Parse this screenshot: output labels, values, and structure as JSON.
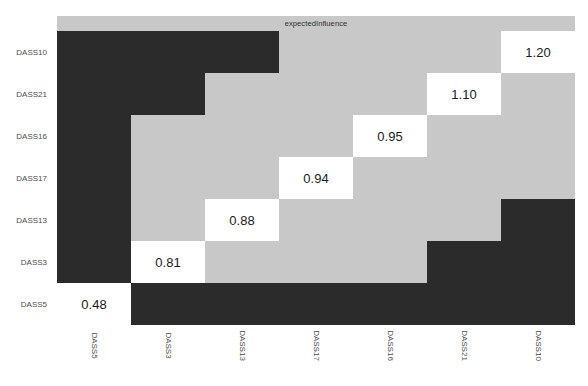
{
  "chart_data": {
    "type": "heatmap",
    "title": "expectedInfluence",
    "xlabel": "",
    "ylabel": "",
    "legend": "none",
    "grid": false,
    "x_categories": [
      "DASS5",
      "DASS3",
      "DASS13",
      "DASS17",
      "DASS16",
      "DASS21",
      "DASS10"
    ],
    "y_categories": [
      "DASS10",
      "DASS21",
      "DASS16",
      "DASS17",
      "DASS13",
      "DASS3",
      "DASS5"
    ],
    "colors": {
      "dark_cell": "#2b2b2b",
      "light_cell": "#c8c8c8",
      "value_cell": "#ffffff",
      "strip_background": "#c8c8c8",
      "text": "#1a1a1a",
      "axis_text": "#4d4d4d"
    },
    "labeled_values": [
      {
        "row": "DASS10",
        "column": "DASS10",
        "value": "1.20"
      },
      {
        "row": "DASS21",
        "column": "DASS21",
        "value": "1.10"
      },
      {
        "row": "DASS16",
        "column": "DASS16",
        "value": "0.95"
      },
      {
        "row": "DASS17",
        "column": "DASS17",
        "value": "0.94"
      },
      {
        "row": "DASS13",
        "column": "DASS13",
        "value": "0.88"
      },
      {
        "row": "DASS3",
        "column": "DASS3",
        "value": "0.81"
      },
      {
        "row": "DASS5",
        "column": "DASS5",
        "value": "0.48"
      }
    ],
    "cells": [
      [
        {
          "state": "dark",
          "label": ""
        },
        {
          "state": "dark",
          "label": ""
        },
        {
          "state": "dark",
          "label": ""
        },
        {
          "state": "light",
          "label": ""
        },
        {
          "state": "light",
          "label": ""
        },
        {
          "state": "light",
          "label": ""
        },
        {
          "state": "value",
          "label": "1.20"
        }
      ],
      [
        {
          "state": "dark",
          "label": ""
        },
        {
          "state": "dark",
          "label": ""
        },
        {
          "state": "light",
          "label": ""
        },
        {
          "state": "light",
          "label": ""
        },
        {
          "state": "light",
          "label": ""
        },
        {
          "state": "value",
          "label": "1.10"
        },
        {
          "state": "light",
          "label": ""
        }
      ],
      [
        {
          "state": "dark",
          "label": ""
        },
        {
          "state": "light",
          "label": ""
        },
        {
          "state": "light",
          "label": ""
        },
        {
          "state": "light",
          "label": ""
        },
        {
          "state": "value",
          "label": "0.95"
        },
        {
          "state": "light",
          "label": ""
        },
        {
          "state": "light",
          "label": ""
        }
      ],
      [
        {
          "state": "dark",
          "label": ""
        },
        {
          "state": "light",
          "label": ""
        },
        {
          "state": "light",
          "label": ""
        },
        {
          "state": "value",
          "label": "0.94"
        },
        {
          "state": "light",
          "label": ""
        },
        {
          "state": "light",
          "label": ""
        },
        {
          "state": "light",
          "label": ""
        }
      ],
      [
        {
          "state": "dark",
          "label": ""
        },
        {
          "state": "light",
          "label": ""
        },
        {
          "state": "value",
          "label": "0.88"
        },
        {
          "state": "light",
          "label": ""
        },
        {
          "state": "light",
          "label": ""
        },
        {
          "state": "light",
          "label": ""
        },
        {
          "state": "dark",
          "label": ""
        }
      ],
      [
        {
          "state": "dark",
          "label": ""
        },
        {
          "state": "value",
          "label": "0.81"
        },
        {
          "state": "light",
          "label": ""
        },
        {
          "state": "light",
          "label": ""
        },
        {
          "state": "light",
          "label": ""
        },
        {
          "state": "dark",
          "label": ""
        },
        {
          "state": "dark",
          "label": ""
        }
      ],
      [
        {
          "state": "value",
          "label": "0.48"
        },
        {
          "state": "dark",
          "label": ""
        },
        {
          "state": "dark",
          "label": ""
        },
        {
          "state": "dark",
          "label": ""
        },
        {
          "state": "dark",
          "label": ""
        },
        {
          "state": "dark",
          "label": ""
        },
        {
          "state": "dark",
          "label": ""
        }
      ]
    ]
  }
}
